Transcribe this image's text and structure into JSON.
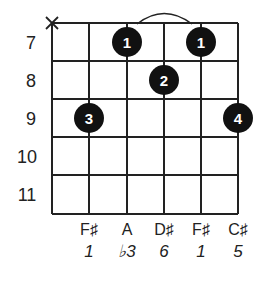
{
  "diagram": {
    "type": "guitar-chord-diagram",
    "muted_string_marker": "X",
    "fret_numbers": [
      "7",
      "8",
      "9",
      "10",
      "11"
    ],
    "barre_arc": {
      "from_string": 3,
      "to_string": 5,
      "fret": 7
    },
    "fingers": [
      {
        "string": 3,
        "fret": 7,
        "finger": "1"
      },
      {
        "string": 5,
        "fret": 7,
        "finger": "1"
      },
      {
        "string": 4,
        "fret": 8,
        "finger": "2"
      },
      {
        "string": 2,
        "fret": 9,
        "finger": "3"
      },
      {
        "string": 6,
        "fret": 9,
        "finger": "4"
      }
    ],
    "notes": [
      "F♯",
      "A",
      "D♯",
      "F♯",
      "C♯"
    ],
    "intervals": [
      "1",
      "♭3",
      "6",
      "1",
      "5"
    ]
  }
}
